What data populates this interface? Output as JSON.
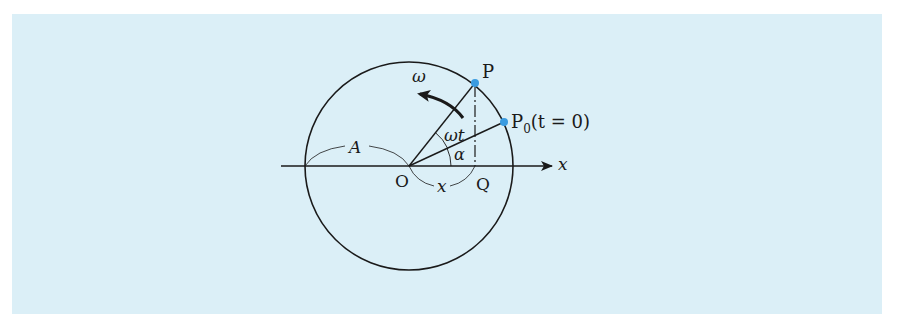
{
  "figure": {
    "background_color": "#dbeff7",
    "point_color": "#3a9be0",
    "line_color": "#1a1a1a"
  },
  "labels": {
    "omega": "ω",
    "P": "P",
    "P0_main": "P",
    "P0_sub": "0",
    "P0_cond": "(t = 0)",
    "omega_t": "ωt",
    "alpha": "α",
    "A": "A",
    "O": "O",
    "x_seg": "x",
    "Q": "Q",
    "x_axis": "x"
  },
  "geometry": {
    "center": [
      409,
      166
    ],
    "radius": 104,
    "point_P": [
      475,
      83
    ],
    "point_P0": [
      504,
      122
    ],
    "point_Q": [
      475,
      166
    ],
    "axis_start_x": 281,
    "axis_end_x": 552
  }
}
